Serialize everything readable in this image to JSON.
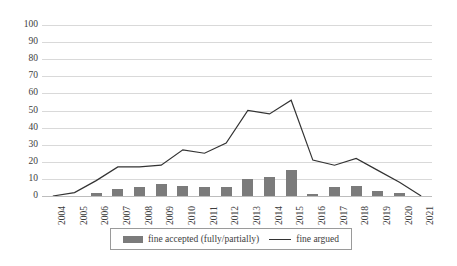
{
  "chart_data": {
    "type": "bar",
    "title": "",
    "xlabel": "",
    "ylabel": "",
    "ylim": [
      0,
      100
    ],
    "ytick_step": 10,
    "grid": true,
    "legend_position": "bottom",
    "categories": [
      "2004",
      "2005",
      "2006",
      "2007",
      "2008",
      "2009",
      "2010",
      "2011",
      "2012",
      "2013",
      "2014",
      "2015",
      "2016",
      "2017",
      "2018",
      "2019",
      "2020",
      "2021"
    ],
    "yticks": [
      "0",
      "10",
      "20",
      "30",
      "40",
      "50",
      "60",
      "70",
      "80",
      "90",
      "100"
    ],
    "series": [
      {
        "name": "fine accepted (fully/partially)",
        "type": "bar",
        "color": "#7b7b7b",
        "values": [
          0,
          0,
          2,
          4,
          5,
          7,
          6,
          5,
          5,
          10,
          11,
          15,
          1,
          5,
          6,
          3,
          2,
          0
        ]
      },
      {
        "name": "fine argued",
        "type": "line",
        "color": "#333333",
        "values": [
          0,
          2,
          9,
          17,
          17,
          18,
          27,
          25,
          31,
          50,
          48,
          56,
          21,
          18,
          22,
          15,
          8,
          0
        ]
      }
    ]
  },
  "legend": {
    "bar_label": "fine accepted (fully/partially)",
    "line_label": "fine argued"
  }
}
